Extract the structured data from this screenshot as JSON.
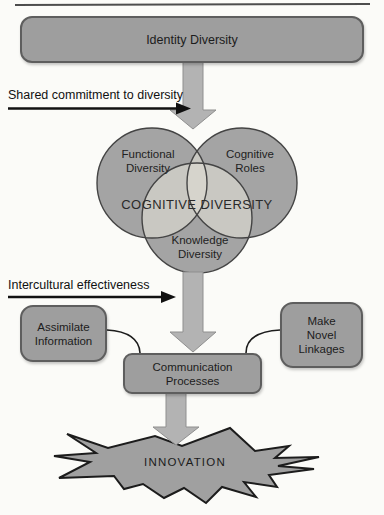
{
  "colors": {
    "page_background": "#fbfbf8",
    "shape_fill": "#9e9e9e",
    "shape_border": "#5e5e5e",
    "circle_fill": "#a4a4a4",
    "circle_outline": "#444444",
    "overlap_fill": "#c9c8c2",
    "core_overlap_fill": "#d6d4cc",
    "block_arrow_fill": "#b3b3b3",
    "block_arrow_outline": "#8f8f8f",
    "callout_arrow_color": "#111111",
    "burst_fill": "#a0a0a0",
    "burst_outline": "#1c1c1c"
  },
  "identity_box": {
    "label": "Identity Diversity"
  },
  "callouts": {
    "shared_commitment": {
      "label": "Shared commitment to diversity"
    },
    "intercultural": {
      "label": "Intercultural effectiveness"
    }
  },
  "venn": {
    "center_label": "COGNITIVE DIVERSITY",
    "functional": {
      "lines": [
        "Functional",
        "Diversity"
      ]
    },
    "cognitive_roles": {
      "lines": [
        "Cognitive",
        "Roles"
      ]
    },
    "knowledge": {
      "lines": [
        "Knowledge",
        "Diversity"
      ]
    }
  },
  "side_boxes": {
    "assimilate_information": {
      "lines": [
        "Assimilate",
        "Information"
      ]
    },
    "make_novel_linkages": {
      "lines": [
        "Make",
        "Novel",
        "Linkages"
      ]
    }
  },
  "communication_box": {
    "lines": [
      "Communication",
      "Processes"
    ]
  },
  "innovation_burst": {
    "label": "INNOVATION"
  }
}
